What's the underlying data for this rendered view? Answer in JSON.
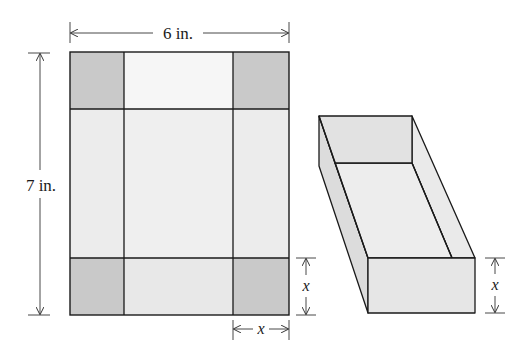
{
  "diagram": {
    "net": {
      "width_label": "6 in.",
      "height_label": "7 in.",
      "corner_cut_label": "x",
      "corner_side_label": "x"
    },
    "box": {
      "height_label": "x"
    },
    "colors": {
      "corner_square": "#c9c9c9",
      "panel": "#ececec",
      "top_panel": "#f6f6f6",
      "box_front": "#e6e6e6",
      "box_floor": "#ededed",
      "box_side_left": "#dcdcdc",
      "box_back": "#e2e2e2",
      "box_side_right": "#eaeaea",
      "line": "#1a1a1a",
      "dim_line": "#333333"
    }
  }
}
